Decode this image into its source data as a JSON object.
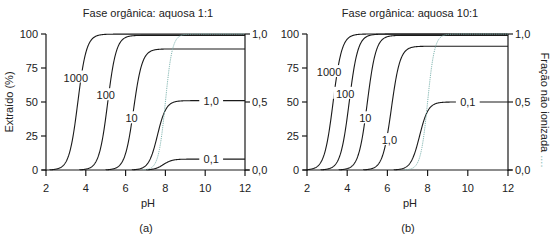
{
  "chart_data": [
    {
      "type": "line",
      "panel_label": "(a)",
      "title": "Fase orgânica: aquosa 1:1",
      "xlabel": "pH",
      "ylabel": "Extraído (%)",
      "y2label": "Fração não ionizada",
      "xlim": [
        2,
        12
      ],
      "ylim": [
        0,
        100
      ],
      "y2lim": [
        0.0,
        1.0
      ],
      "xticks": [
        "2",
        "4",
        "6",
        "8",
        "10",
        "12"
      ],
      "yticks": [
        "0",
        "25",
        "50",
        "75",
        "100"
      ],
      "y2ticks": [
        "0,0",
        "0,5",
        "1,0"
      ],
      "grid": false,
      "series": [
        {
          "name": "1000",
          "midpoint_pH": 3.6,
          "plateau": 99.9,
          "label_pH": 3.5,
          "label_y": 68
        },
        {
          "name": "100",
          "midpoint_pH": 5.1,
          "plateau": 99.0,
          "label_pH": 5.0,
          "label_y": 55
        },
        {
          "name": "10",
          "midpoint_pH": 6.4,
          "plateau": 89.0,
          "label_pH": 6.3,
          "label_y": 38
        },
        {
          "name": "1,0",
          "midpoint_pH": 7.6,
          "plateau": 51.0,
          "label_pH": 10.3,
          "label_y": 51
        },
        {
          "name": "0,1",
          "midpoint_pH": 7.9,
          "plateau": 8.0,
          "label_pH": 10.3,
          "label_y": 8
        },
        {
          "name": "Fração não ionizada",
          "style": "dotted",
          "midpoint_pH": 8.0,
          "plateau": 100.0
        }
      ]
    },
    {
      "type": "line",
      "panel_label": "(b)",
      "title": "Fase orgânica: aquosa 10:1",
      "xlabel": "pH",
      "ylabel": "Extraído (%)",
      "y2label": "Fração não ionizada",
      "xlim": [
        2,
        12
      ],
      "ylim": [
        0,
        100
      ],
      "y2lim": [
        0.0,
        1.0
      ],
      "xticks": [
        "2",
        "4",
        "6",
        "8",
        "10",
        "12"
      ],
      "yticks": [
        "0",
        "25",
        "50",
        "75",
        "100"
      ],
      "y2ticks": [
        "0,0",
        "0,5",
        "1,0"
      ],
      "grid": false,
      "series": [
        {
          "name": "1000",
          "midpoint_pH": 3.3,
          "plateau": 100.0,
          "label_pH": 3.1,
          "label_y": 72
        },
        {
          "name": "100",
          "midpoint_pH": 4.1,
          "plateau": 99.9,
          "label_pH": 3.9,
          "label_y": 56
        },
        {
          "name": "10",
          "midpoint_pH": 5.0,
          "plateau": 99.0,
          "label_pH": 4.9,
          "label_y": 38
        },
        {
          "name": "1,0",
          "midpoint_pH": 6.2,
          "plateau": 91.0,
          "label_pH": 6.1,
          "label_y": 22
        },
        {
          "name": "0,1",
          "midpoint_pH": 7.6,
          "plateau": 50.0,
          "label_pH": 10.0,
          "label_y": 50
        },
        {
          "name": "Fração não ionizada",
          "style": "dotted",
          "midpoint_pH": 8.0,
          "plateau": 100.0
        }
      ]
    }
  ],
  "colors": {
    "curve": "#1a1a1a",
    "dotted": "#7fb5b0",
    "axis": "#1a1a1a",
    "text": "#222222"
  },
  "y2_label_suffix": "...."
}
